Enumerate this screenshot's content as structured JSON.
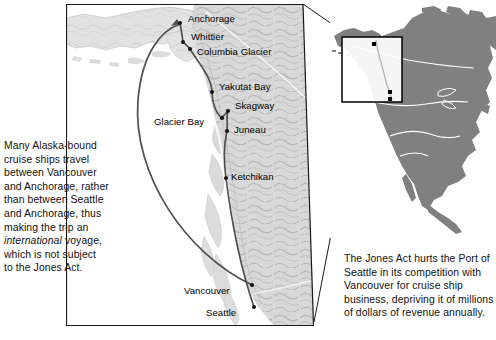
{
  "figure": {
    "type": "thematic-map"
  },
  "captions": {
    "left": {
      "name": "left-caption",
      "line1": "Many Alaska-bound",
      "line2": "cruise ships travel",
      "line3": "between Vancouver",
      "line4": "and Anchorage, rather",
      "line5": "than between Seattle",
      "line6": "and Anchorage, thus",
      "line7": "making the trip an",
      "line8_italic": "international",
      "line8_rest": " voyage,",
      "line9": "which is not subject",
      "line10": "to the Jones Act."
    },
    "right": {
      "name": "right-caption",
      "line1": "The Jones Act hurts the Port of",
      "line2": "Seattle in its competition with",
      "line3": "Vancouver for cruise ship",
      "line4": "business, depriving it of millions",
      "line5": "of dollars of revenue annually."
    }
  },
  "main_map": {
    "name": "alaska-british-columbia-detail-map",
    "frame_color": "#1a1a1a",
    "land_color": "#d6d6d6",
    "water_color": "#ffffff",
    "route_color": "#4a4a4a",
    "cities": [
      {
        "label": "Anchorage",
        "x": 114,
        "y": 19,
        "label_dx": 8,
        "label_dy": -9,
        "dot": true
      },
      {
        "label": "Whittier",
        "x": 117,
        "y": 38,
        "label_dx": 8,
        "label_dy": -10,
        "dot": true
      },
      {
        "label": "Columbia Glacier",
        "x": 124,
        "y": 45,
        "label_dx": 7,
        "label_dy": 1,
        "dot": true
      },
      {
        "label": "Yakutat Bay",
        "x": 146,
        "y": 88,
        "label_dx": 7,
        "label_dy": -9,
        "dot": true
      },
      {
        "label": "Skagway",
        "x": 162,
        "y": 107,
        "label_dx": 7,
        "label_dy": -9,
        "dot": true
      },
      {
        "label": "Glacier Bay",
        "x": 156,
        "y": 114,
        "label_dx": -80,
        "label_dy": 3,
        "dot": true
      },
      {
        "label": "Juneau",
        "x": 161,
        "y": 127,
        "label_dx": 7,
        "label_dy": -4,
        "dot": true
      },
      {
        "label": "Ketchikan",
        "x": 160,
        "y": 174,
        "label_dx": 5,
        "label_dy": -5,
        "dot": true
      },
      {
        "label": "Vancouver",
        "x": 186,
        "y": 281,
        "label_dx": -60,
        "label_dy": 2,
        "dot": true
      },
      {
        "label": "Seattle",
        "x": 188,
        "y": 303,
        "label_dx": -44,
        "label_dy": 2,
        "dot": true
      }
    ]
  },
  "inset_map": {
    "name": "north-america-locator-map",
    "continent": "North America",
    "land_color": "#808080",
    "border_color": "#ffffff",
    "locator_box_color": "#000000",
    "locator_fill": "#ffffff",
    "marker_count": 3
  },
  "leader_lines": {
    "name": "inset-leader-lines",
    "color": "#1a1a1a",
    "count": 2
  }
}
